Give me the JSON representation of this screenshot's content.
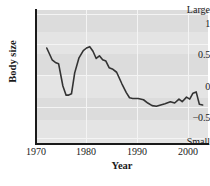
{
  "chart_data": {
    "type": "line",
    "title": "",
    "xlabel": "Year",
    "ylabel": "Body size",
    "xlim": [
      1970,
      2002
    ],
    "ylim": [
      -0.85,
      1.18
    ],
    "xticks": [
      1970,
      1980,
      1990,
      2000
    ],
    "yticks": [
      1,
      0.5,
      0,
      -0.5
    ],
    "ytick_labels": [
      "1",
      "0.5",
      "0",
      "−0.5"
    ],
    "y_axis_top_label": "Large",
    "y_axis_bottom_label": "Small",
    "grid": "banded-horizontal-and-vertical",
    "legend": "none",
    "series": [
      {
        "name": "Body size index",
        "x": [
          1972.0,
          1973.0,
          1973.6,
          1974.2,
          1975.0,
          1975.6,
          1976.0,
          1976.6,
          1977.2,
          1978.0,
          1978.8,
          1979.4,
          1980.0,
          1980.6,
          1981.2,
          1981.8,
          1982.4,
          1983.0,
          1983.6,
          1984.2,
          1985.0,
          1986.0,
          1986.8,
          1987.4,
          1988.0,
          1989.0,
          1990.0,
          1990.8,
          1991.6,
          1992.4,
          1993.2,
          1994.0,
          1995.0,
          1995.8,
          1996.6,
          1997.2,
          1998.0,
          1998.6,
          1999.2,
          1999.8,
          2000.4,
          2001.0
        ],
        "y": [
          0.6,
          0.42,
          0.38,
          0.36,
          0.02,
          -0.12,
          -0.12,
          -0.1,
          0.22,
          0.45,
          0.56,
          0.6,
          0.62,
          0.55,
          0.44,
          0.48,
          0.42,
          0.4,
          0.3,
          0.28,
          0.23,
          0.05,
          -0.08,
          -0.16,
          -0.17,
          -0.17,
          -0.19,
          -0.24,
          -0.28,
          -0.29,
          -0.27,
          -0.25,
          -0.22,
          -0.24,
          -0.18,
          -0.22,
          -0.15,
          -0.18,
          -0.09,
          -0.07,
          -0.26,
          -0.27
        ]
      }
    ]
  },
  "axes": {
    "xtick_labels": [
      "1970",
      "1980",
      "1990",
      "2000"
    ],
    "xlabel": "Year",
    "ylabel": "Body size",
    "ytick_labels": [
      "1",
      "0.5",
      "0",
      "−0.5"
    ],
    "y_top": "Large",
    "y_bottom": "Small"
  },
  "colors": {
    "plot_background": "#e4e4e4",
    "band": "#dcdcdc",
    "gridline": "#f4f4f4",
    "line": "#333333",
    "axis": "#1a1a1a",
    "page": "#ffffff"
  }
}
